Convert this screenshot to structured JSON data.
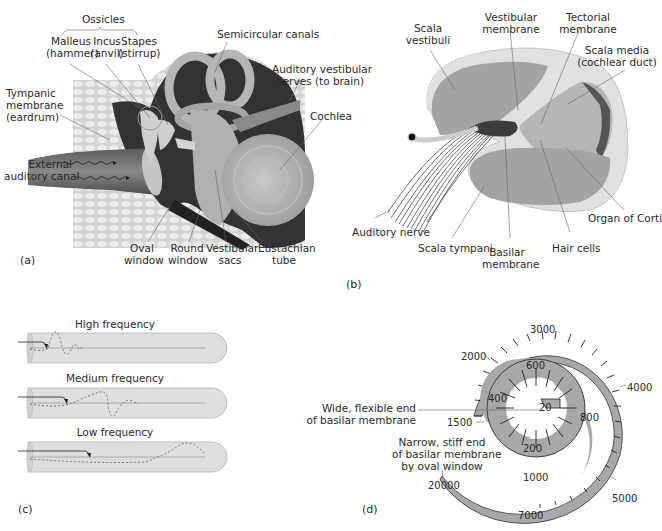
{
  "figure": {
    "colors": {
      "background": "#ffffff",
      "text": "#2a2a2a",
      "bone_texture": "#d9d9d9",
      "dark_tissue": "#3a3a3a",
      "mid_gray": "#9a9a9a",
      "light_gray": "#c8c8c8",
      "tube_fill": "#dedede",
      "spiral_fill": "#a8a8a8"
    }
  },
  "panel_a": {
    "tag": "(a)",
    "title": "Ear anatomy",
    "labels": {
      "ossicles": "Ossicles",
      "malleus": "Malleus",
      "malleus_sub": "(hammer)",
      "incus": "Incus",
      "incus_sub": "(anvil)",
      "stapes": "Stapes",
      "stapes_sub": "(stirrup)",
      "semicircular": "Semicircular canals",
      "auditory_vestibular_1": "Auditory vestibular",
      "auditory_vestibular_2": "nerves (to brain)",
      "cochlea": "Cochlea",
      "tympanic_1": "Tympanic",
      "tympanic_2": "membrane",
      "tympanic_3": "(eardrum)",
      "external_1": "External",
      "external_2": "auditory canal",
      "oval_1": "Oval",
      "oval_2": "window",
      "round_1": "Round",
      "round_2": "window",
      "vestibular_sacs_1": "Vestibular",
      "vestibular_sacs_2": "sacs",
      "eustachian_1": "Eustachian",
      "eustachian_2": "tube"
    }
  },
  "panel_b": {
    "tag": "(b)",
    "title": "Cochlea cross-section",
    "labels": {
      "scala_vestibuli_1": "Scala",
      "scala_vestibuli_2": "vestibuli",
      "vestibular_membrane_1": "Vestibular",
      "vestibular_membrane_2": "membrane",
      "tectorial_1": "Tectorial",
      "tectorial_2": "membrane",
      "scala_media_1": "Scala media",
      "scala_media_2": "(cochlear duct)",
      "organ_corti": "Organ of Corti",
      "auditory_nerve": "Auditory nerve",
      "scala_tympani": "Scala tympani",
      "basilar_1": "Basilar",
      "basilar_2": "membrane",
      "hair_cells": "Hair cells"
    }
  },
  "panel_c": {
    "tag": "(c)",
    "title": "Traveling waves along basilar membrane",
    "rows": [
      {
        "label": "High frequency"
      },
      {
        "label": "Medium frequency"
      },
      {
        "label": "Low frequency"
      }
    ]
  },
  "panel_d": {
    "tag": "(d)",
    "title": "Tonotopic map of basilar membrane (Hz)",
    "wide_end_1": "Wide, flexible end",
    "wide_end_2": "of basilar membrane",
    "narrow_end_1": "Narrow, stiff end",
    "narrow_end_2": "of basilar membrane",
    "narrow_end_3": "by oval window",
    "frequencies": {
      "f20": "20",
      "f200": "200",
      "f400": "400",
      "f600": "600",
      "f800": "800",
      "f1000": "1000",
      "f1500": "1500",
      "f2000": "2000",
      "f3000": "3000",
      "f4000": "4000",
      "f5000": "5000",
      "f7000": "7000",
      "f20000": "20000"
    }
  }
}
